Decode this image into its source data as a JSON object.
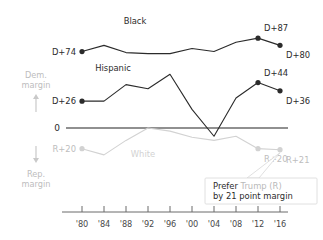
{
  "chart_data": {
    "type": "line",
    "title": "",
    "xlabel": "",
    "ylabel": "",
    "x": [
      "'80",
      "'84",
      "'88",
      "'92",
      "'96",
      "'00",
      "'04",
      "'08",
      "'12",
      "'16"
    ],
    "xtick_labels": [
      "'80",
      "'84",
      "'88",
      "'92",
      "'96",
      "'00",
      "'04",
      "'08",
      "'12",
      "'16"
    ],
    "grid": false,
    "legend_position": "inline",
    "ylim": [
      -30,
      95
    ],
    "yzero_label": "0",
    "axis_note_top": "Dem. margin",
    "axis_note_bottom": "Rep. margin",
    "series": [
      {
        "name": "Black",
        "color": "#2b2b2b",
        "label": "Black",
        "label_x": 135,
        "label_y": 24,
        "values": [
          74,
          80,
          73,
          72,
          72,
          77,
          74,
          83,
          87,
          80
        ],
        "endpoint_labels": [
          {
            "text": "D+74",
            "index": 0,
            "align": "right"
          },
          {
            "text": "D+87",
            "index": 8,
            "align": "left"
          },
          {
            "text": "D+80",
            "index": 9,
            "align": "left"
          }
        ],
        "marked_points": [
          0,
          8,
          9
        ]
      },
      {
        "name": "Hispanic",
        "color": "#2b2b2b",
        "label": "Hispanic",
        "label_x": 113,
        "label_y": 71,
        "values": [
          26,
          26,
          42,
          38,
          52,
          18,
          -8,
          29,
          44,
          36
        ],
        "endpoint_labels": [
          {
            "text": "D+26",
            "index": 0,
            "align": "right"
          },
          {
            "text": "D+44",
            "index": 8,
            "align": "left"
          },
          {
            "text": "D+36",
            "index": 9,
            "align": "left"
          }
        ],
        "marked_points": [
          0,
          8,
          9
        ]
      },
      {
        "name": "White",
        "color": "#d2d2d2",
        "label": "White",
        "label_x": 143,
        "label_y": 157,
        "values": [
          -20,
          -26,
          -12,
          0,
          -3,
          -9,
          -12,
          -8,
          -20,
          -21
        ],
        "endpoint_labels": [
          {
            "text": "R+20",
            "index": 0,
            "align": "right"
          },
          {
            "text": "R+20",
            "index": 8,
            "align": "left"
          },
          {
            "text": "R+21",
            "index": 9,
            "align": "left"
          }
        ],
        "marked_points": [
          0,
          8,
          9
        ]
      }
    ],
    "annotation": {
      "line1": "Prefer Trump (R)",
      "line2": "by 21 point margin",
      "highlight_word_1": "Prefer",
      "highlight_word_2": "Trump (R)",
      "target_series": "White",
      "target_index": 9
    },
    "colors": {
      "dem_dark": "#2b2b2b",
      "white_series": "#d2d2d2",
      "muted_label": "#bdbdbd",
      "axis": "#6b6b6b",
      "tooltip_border": "#d8d8d8"
    }
  }
}
